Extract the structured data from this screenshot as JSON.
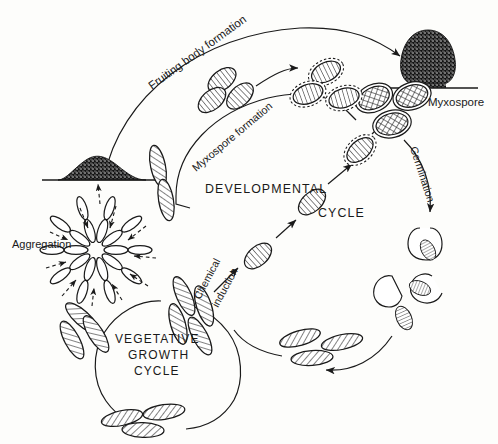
{
  "diagram": {
    "background_color": "#fdfdfb",
    "ink_color": "#1a1a1a"
  },
  "labels": {
    "fruiting_body_formation": "Fruiting body formation",
    "myxospore_formation": "Myxospore formation",
    "myxospore": "Myxospore",
    "germination": "Germination",
    "aggregation": "Aggregation",
    "chemical": "Chemical",
    "induction": "induction",
    "developmental": "DEVELOPMENTAL",
    "cycle_dev": "CYCLE",
    "vegetative": "VEGETATIVE",
    "growth": "GROWTH",
    "cycle_veg": "CYCLE"
  },
  "structures": [
    {
      "name": "aggregation-mound",
      "kind": "stippled-mound",
      "description": "dark stippled aggregation mound on substrate line"
    },
    {
      "name": "fruiting-body",
      "kind": "stippled-fruiting-body",
      "description": "dark stippled mushroom-shaped fruiting body on substrate line"
    },
    {
      "name": "myxospore-cluster",
      "kind": "crosshatched-spores",
      "count": 3
    },
    {
      "name": "germinating-spore-group",
      "kind": "splitting-capsules",
      "count": 3
    },
    {
      "name": "vegetative-rod-cluster",
      "kind": "hatched-rods"
    }
  ],
  "arrows": [
    {
      "name": "aggregation-to-fruiting-body",
      "style": "solid-curve"
    },
    {
      "name": "rods-to-myxospores",
      "style": "solid-curve"
    },
    {
      "name": "myxospores-to-fruiting-body",
      "style": "solid-curve"
    },
    {
      "name": "myxospore-germination",
      "style": "solid-curve"
    },
    {
      "name": "germinated-cells-to-vegetative",
      "style": "solid-curve"
    },
    {
      "name": "chemical-induction-path",
      "style": "solid-diagonal"
    },
    {
      "name": "aggregation-inflow",
      "style": "dashed-radial"
    }
  ]
}
